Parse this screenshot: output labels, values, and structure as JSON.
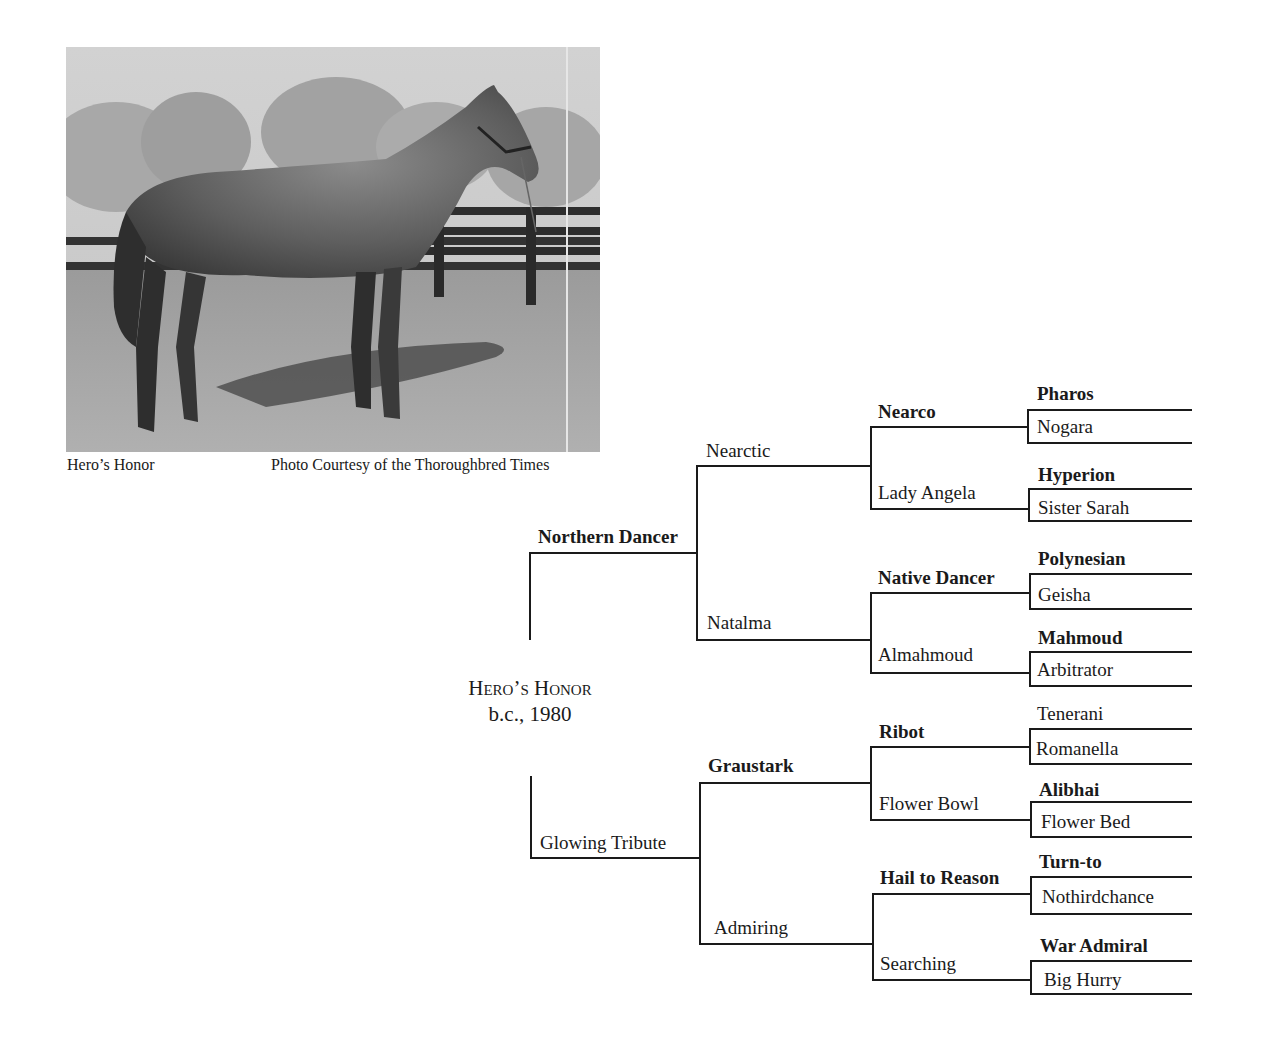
{
  "photo": {
    "caption_left": "Hero’s Honor",
    "caption_right": "Photo Courtesy of the Thoroughbred Times"
  },
  "subject": {
    "name": "Hero’s Honor",
    "details": "b.c., 1980"
  },
  "pedigree": {
    "sire": {
      "name": "Northern Dancer",
      "bold": true
    },
    "dam": {
      "name": "Glowing Tribute",
      "bold": false
    },
    "gen2": [
      {
        "name": "Nearctic",
        "bold": false
      },
      {
        "name": "Natalma",
        "bold": false
      },
      {
        "name": "Graustark",
        "bold": true
      },
      {
        "name": "Admiring",
        "bold": false
      }
    ],
    "gen3": [
      {
        "name": "Nearco",
        "bold": true
      },
      {
        "name": "Lady Angela",
        "bold": false
      },
      {
        "name": "Native Dancer",
        "bold": true
      },
      {
        "name": "Almahmoud",
        "bold": false
      },
      {
        "name": "Ribot",
        "bold": true
      },
      {
        "name": "Flower Bowl",
        "bold": false
      },
      {
        "name": "Hail to Reason",
        "bold": true
      },
      {
        "name": "Searching",
        "bold": false
      }
    ],
    "gen4": [
      {
        "name": "Pharos",
        "bold": true
      },
      {
        "name": "Nogara",
        "bold": false
      },
      {
        "name": "Hyperion",
        "bold": true
      },
      {
        "name": "Sister Sarah",
        "bold": false
      },
      {
        "name": "Polynesian",
        "bold": true
      },
      {
        "name": "Geisha",
        "bold": false
      },
      {
        "name": "Mahmoud",
        "bold": true
      },
      {
        "name": "Arbitrator",
        "bold": false
      },
      {
        "name": "Tenerani",
        "bold": false
      },
      {
        "name": "Romanella",
        "bold": false
      },
      {
        "name": "Alibhai",
        "bold": true
      },
      {
        "name": "Flower Bed",
        "bold": false
      },
      {
        "name": "Turn-to",
        "bold": true
      },
      {
        "name": "Nothirdchance",
        "bold": false
      },
      {
        "name": "War Admiral",
        "bold": true
      },
      {
        "name": "Big Hurry",
        "bold": false
      }
    ]
  }
}
